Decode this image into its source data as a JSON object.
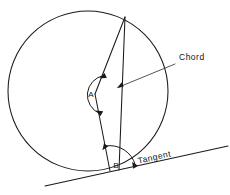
{
  "figure": {
    "type": "geometry-diagram",
    "background_color": "#ffffff",
    "ink_color": "#1a1a1a",
    "width": 230,
    "height": 195
  },
  "labels": {
    "chord": "Chord",
    "tangent": "Tangent",
    "angle_center": "A",
    "angle_tangent": "B"
  },
  "geometry": {
    "circle": {
      "cx": 88,
      "cy": 91,
      "r": 80,
      "name": "circle-outline"
    },
    "points": {
      "apex": {
        "x": 125,
        "y": 17,
        "name": "chord-top-endpoint"
      },
      "center": {
        "x": 95,
        "y": 94,
        "name": "circle-center-vertex-a"
      },
      "tangent_point": {
        "x": 110,
        "y": 171,
        "name": "tangency-point-vertex-b"
      },
      "chord_bottom": {
        "x": 119,
        "y": 170,
        "name": "chord-bottom-endpoint"
      }
    },
    "tangent_line": {
      "x1": 45,
      "y1": 186,
      "x2": 228,
      "y2": 146,
      "name": "tangent-line"
    },
    "chord_leader": {
      "x1": 118,
      "y1": 88,
      "x2": 175,
      "y2": 64,
      "name": "chord-leader-line"
    },
    "tangent_label_rotation_deg": -12.5,
    "angle_a_arc": {
      "radius": 20,
      "description": "double-headed arc marking central angle A"
    },
    "angle_b_arc": {
      "radius": 26,
      "description": "double-headed arc marking tangent-chord angle B"
    }
  }
}
